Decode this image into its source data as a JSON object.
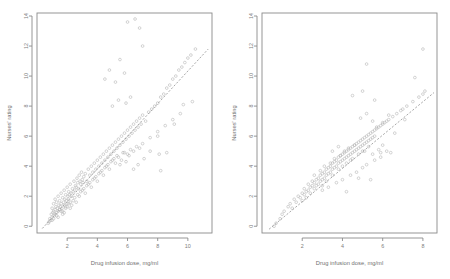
{
  "figure": {
    "background": "#ffffff",
    "point_color": "#b9b9b9",
    "line_color": "#9a9a9a",
    "axis_color": "#8a8a8a",
    "text_color": "#7d7d7d"
  },
  "chart_data": [
    {
      "type": "scatter",
      "panel": "left",
      "title": "",
      "xlabel": "Drug infusion dose, mg/ml",
      "ylabel": "Nurses' rating",
      "xlim": [
        0.0,
        11.6
      ],
      "ylim": [
        -0.45,
        14.2
      ],
      "xticks": [
        2,
        4,
        6,
        8,
        10
      ],
      "yticks": [
        0,
        2,
        4,
        6,
        8,
        10,
        12,
        14
      ],
      "grid": false,
      "legend": "none",
      "marker": "open-circle",
      "fit_line": {
        "style": "dashed",
        "x": [
          0.35,
          11.35
        ],
        "y": [
          -0.15,
          11.8
        ],
        "slope": 1.086,
        "intercept": -0.53
      },
      "x": [
        0.75,
        0.8,
        0.85,
        0.9,
        0.95,
        1.0,
        1.0,
        1.05,
        1.1,
        1.1,
        1.15,
        1.2,
        1.2,
        1.25,
        1.3,
        1.3,
        1.35,
        1.4,
        1.4,
        1.45,
        1.5,
        1.5,
        1.55,
        1.6,
        1.6,
        1.65,
        1.7,
        1.7,
        1.75,
        1.8,
        1.8,
        1.85,
        1.9,
        1.9,
        1.95,
        2.0,
        2.0,
        2.05,
        2.1,
        2.1,
        2.15,
        2.2,
        2.2,
        2.25,
        2.3,
        2.35,
        2.4,
        2.45,
        2.5,
        2.55,
        2.6,
        2.65,
        2.7,
        2.75,
        2.8,
        2.85,
        2.9,
        2.95,
        3.0,
        3.05,
        3.1,
        3.2,
        3.3,
        3.4,
        3.5,
        3.6,
        3.7,
        3.8,
        3.9,
        4.0,
        4.1,
        4.2,
        4.3,
        4.4,
        4.5,
        4.6,
        4.7,
        4.8,
        4.9,
        5.0,
        5.1,
        5.2,
        5.3,
        5.4,
        5.5,
        5.6,
        5.7,
        5.8,
        5.9,
        6.0,
        6.1,
        6.2,
        6.3,
        6.4,
        6.5,
        6.6,
        6.7,
        6.8,
        6.9,
        7.0,
        7.2,
        7.4,
        7.6,
        7.8,
        8.0,
        8.2,
        8.4,
        8.6,
        8.8,
        9.0,
        9.2,
        9.4,
        9.6,
        9.8,
        10.0,
        10.2,
        10.5,
        1.0,
        1.2,
        1.4,
        1.6,
        1.8,
        2.0,
        2.2,
        2.4,
        2.6,
        2.8,
        3.0,
        3.2,
        3.4,
        3.6,
        3.8,
        4.0,
        4.2,
        4.4,
        4.6,
        4.8,
        5.0,
        5.2,
        5.4,
        5.6,
        5.8,
        6.0,
        6.2,
        6.4,
        6.6,
        6.8,
        7.0,
        7.5,
        8.0,
        8.5,
        9.0,
        9.5,
        4.5,
        4.8,
        5.2,
        5.5,
        5.8,
        6.0,
        6.5,
        6.8,
        7.0,
        5.0,
        5.4,
        5.9,
        6.2,
        8.0,
        8.1,
        1.1,
        1.3,
        1.5,
        1.7,
        1.9,
        2.1,
        2.3,
        2.5,
        2.7,
        2.9,
        3.1,
        3.3,
        3.5,
        3.7,
        3.9,
        4.1,
        4.3,
        4.5,
        4.7,
        4.9,
        5.1,
        5.3,
        5.5,
        5.7,
        5.9,
        6.1,
        6.4,
        6.7,
        7.1,
        7.5,
        8.2,
        8.6,
        9.1,
        9.7,
        10.3
      ],
      "y": [
        0.2,
        0.3,
        0.5,
        0.4,
        0.8,
        0.6,
        1.2,
        0.9,
        1.0,
        1.5,
        0.7,
        1.1,
        1.8,
        1.3,
        0.9,
        1.6,
        1.2,
        1.0,
        2.0,
        1.4,
        1.1,
        1.7,
        1.3,
        1.5,
        2.2,
        1.2,
        1.0,
        1.9,
        1.6,
        1.4,
        2.4,
        1.8,
        1.3,
        2.1,
        1.7,
        1.5,
        2.6,
        2.0,
        1.8,
        2.3,
        2.1,
        1.6,
        2.8,
        2.2,
        2.0,
        2.5,
        2.3,
        3.0,
        2.4,
        2.7,
        2.6,
        3.2,
        2.9,
        2.5,
        3.4,
        3.0,
        2.8,
        3.6,
        3.1,
        2.9,
        3.3,
        3.5,
        3.0,
        3.8,
        3.4,
        4.0,
        3.6,
        4.2,
        3.8,
        4.4,
        4.0,
        4.6,
        4.2,
        4.8,
        4.4,
        5.0,
        4.6,
        5.2,
        4.8,
        5.4,
        5.0,
        5.6,
        5.2,
        5.8,
        5.4,
        6.0,
        5.6,
        6.2,
        5.8,
        6.4,
        6.0,
        6.6,
        6.2,
        6.8,
        6.4,
        7.0,
        6.6,
        7.2,
        6.8,
        7.4,
        7.0,
        7.6,
        7.8,
        8.0,
        8.2,
        8.6,
        8.8,
        9.2,
        9.4,
        9.8,
        10.0,
        10.4,
        10.6,
        10.9,
        11.2,
        11.4,
        11.8,
        0.4,
        0.8,
        0.6,
        1.0,
        0.9,
        1.3,
        1.2,
        1.7,
        1.6,
        2.0,
        2.4,
        2.2,
        2.8,
        2.6,
        3.2,
        3.0,
        3.6,
        3.4,
        4.0,
        3.8,
        4.4,
        4.2,
        4.6,
        4.4,
        4.9,
        4.8,
        5.1,
        5.0,
        5.3,
        5.2,
        5.5,
        5.9,
        6.3,
        6.7,
        7.1,
        7.5,
        9.8,
        10.4,
        9.6,
        11.1,
        10.2,
        13.6,
        13.8,
        13.2,
        12.0,
        8.0,
        8.4,
        8.2,
        8.6,
        6.0,
        4.8,
        0.5,
        0.7,
        1.1,
        0.8,
        1.2,
        1.5,
        1.4,
        1.9,
        2.1,
        2.3,
        2.5,
        2.7,
        2.9,
        3.1,
        3.3,
        3.5,
        3.7,
        3.9,
        4.1,
        4.3,
        4.5,
        4.7,
        4.1,
        4.9,
        4.3,
        4.7,
        3.8,
        4.1,
        4.5,
        5.0,
        3.7,
        4.9,
        6.8,
        8.1,
        8.3
      ]
    },
    {
      "type": "scatter",
      "panel": "right",
      "title": "",
      "xlabel": "Drug infusion dose, mg/ml",
      "ylabel": "Nurses' rating",
      "xlim": [
        0.0,
        8.7
      ],
      "ylim": [
        -0.45,
        14.2
      ],
      "xticks": [
        2,
        4,
        6,
        8
      ],
      "yticks": [
        0,
        2,
        4,
        6,
        8,
        10,
        12,
        14
      ],
      "grid": false,
      "legend": "none",
      "marker": "open-circle",
      "fit_line": {
        "style": "dashed",
        "x": [
          0.35,
          8.55
        ],
        "y": [
          -0.2,
          8.9
        ],
        "slope": 1.11,
        "intercept": -0.59
      },
      "x": [
        0.6,
        0.7,
        0.9,
        1.0,
        1.1,
        1.3,
        1.4,
        1.5,
        1.6,
        1.7,
        1.8,
        1.9,
        2.0,
        2.0,
        2.1,
        2.1,
        2.2,
        2.2,
        2.3,
        2.3,
        2.4,
        2.4,
        2.5,
        2.5,
        2.6,
        2.6,
        2.7,
        2.7,
        2.8,
        2.8,
        2.9,
        2.9,
        3.0,
        3.0,
        3.0,
        3.1,
        3.1,
        3.2,
        3.2,
        3.2,
        3.3,
        3.3,
        3.4,
        3.4,
        3.5,
        3.5,
        3.5,
        3.6,
        3.6,
        3.7,
        3.7,
        3.8,
        3.8,
        3.8,
        3.9,
        3.9,
        4.0,
        4.0,
        4.0,
        4.1,
        4.1,
        4.2,
        4.2,
        4.2,
        4.3,
        4.3,
        4.4,
        4.4,
        4.4,
        4.5,
        4.5,
        4.5,
        4.6,
        4.6,
        4.7,
        4.7,
        4.8,
        4.8,
        4.9,
        4.9,
        5.0,
        5.0,
        5.0,
        5.1,
        5.1,
        5.2,
        5.2,
        5.3,
        5.3,
        5.4,
        5.4,
        5.5,
        5.5,
        5.6,
        5.6,
        5.7,
        5.8,
        5.9,
        6.0,
        6.1,
        6.2,
        6.3,
        6.5,
        6.7,
        6.9,
        7.0,
        7.2,
        7.5,
        7.8,
        8.0,
        8.1,
        2.6,
        2.9,
        3.1,
        3.4,
        3.6,
        3.9,
        4.1,
        4.3,
        4.6,
        4.8,
        5.1,
        5.3,
        5.5,
        5.8,
        6.0,
        6.2,
        3.0,
        3.3,
        3.7,
        4.0,
        4.4,
        4.7,
        5.0,
        5.2,
        5.6,
        5.9,
        4.9,
        5.2,
        5.5,
        5.7,
        6.0,
        6.3,
        6.6,
        7.1,
        7.6,
        8.0,
        3.8,
        4.5,
        5.0,
        5.2,
        5.6,
        3.5,
        4.2,
        4.8,
        5.4,
        5.9,
        6.4
      ],
      "y": [
        0.0,
        0.2,
        0.5,
        0.8,
        1.0,
        1.3,
        1.5,
        1.2,
        1.8,
        1.6,
        2.0,
        1.9,
        2.2,
        1.7,
        2.1,
        2.5,
        2.3,
        1.9,
        2.4,
        2.8,
        2.6,
        2.2,
        2.7,
        3.0,
        2.9,
        2.5,
        3.1,
        2.7,
        3.2,
        2.8,
        3.4,
        3.0,
        3.5,
        3.1,
        2.7,
        3.6,
        3.2,
        3.8,
        3.4,
        3.0,
        3.9,
        3.5,
        4.0,
        3.6,
        4.2,
        3.8,
        3.4,
        4.3,
        3.9,
        4.4,
        4.0,
        4.6,
        4.2,
        3.8,
        4.7,
        4.3,
        4.8,
        4.4,
        4.0,
        4.9,
        4.5,
        5.0,
        4.6,
        4.2,
        5.1,
        4.7,
        5.2,
        4.8,
        4.4,
        5.3,
        4.9,
        4.5,
        5.4,
        5.0,
        5.5,
        5.1,
        5.6,
        5.2,
        5.7,
        5.3,
        5.8,
        5.4,
        5.0,
        5.9,
        5.5,
        6.0,
        5.6,
        6.1,
        5.7,
        6.2,
        5.8,
        6.3,
        5.9,
        6.4,
        6.0,
        6.5,
        6.6,
        6.7,
        6.8,
        6.9,
        7.0,
        7.1,
        7.3,
        7.5,
        7.7,
        7.8,
        8.0,
        8.3,
        8.6,
        8.8,
        9.0,
        3.4,
        3.7,
        4.0,
        4.2,
        4.5,
        4.7,
        5.0,
        5.2,
        5.4,
        4.8,
        5.0,
        5.3,
        4.8,
        5.1,
        5.4,
        5.0,
        2.4,
        2.6,
        2.9,
        3.1,
        3.4,
        3.6,
        3.9,
        4.1,
        4.4,
        4.6,
        7.2,
        7.5,
        7.0,
        6.6,
        6.9,
        7.4,
        6.2,
        7.1,
        9.9,
        11.8,
        5.3,
        8.7,
        9.0,
        10.8,
        8.4,
        5.0,
        2.3,
        3.2,
        3.1,
        4.9,
        4.9
      ]
    }
  ]
}
